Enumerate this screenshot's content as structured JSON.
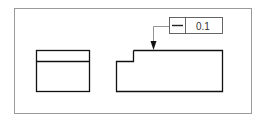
{
  "drawing": {
    "title": "Flatness tolerance callout",
    "feature_control_frame": {
      "symbol": "flatness",
      "symbol_glyph": "—",
      "tolerance": "0.1"
    },
    "colors": {
      "frame_border": "#9a9a9a",
      "part_outline": "#111111",
      "leader": "#888888"
    }
  }
}
